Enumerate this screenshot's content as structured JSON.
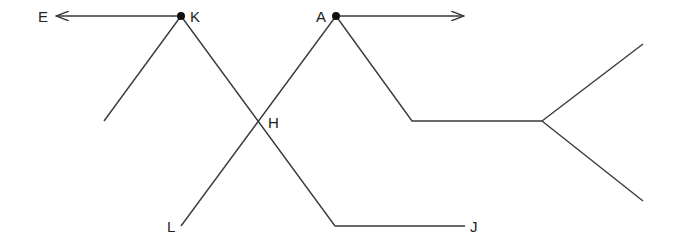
{
  "labels": {
    "E": "E",
    "K": "K",
    "A": "A",
    "H": "H",
    "L": "L",
    "J": "J"
  },
  "points": {
    "K": [
      181,
      16
    ],
    "A": [
      336,
      16
    ],
    "H": [
      257,
      119
    ],
    "L": [
      181,
      226
    ],
    "J": [
      465,
      226
    ]
  },
  "colors": {
    "line": "#3a3a3a",
    "point": "#111111",
    "background": "#ffffff"
  }
}
